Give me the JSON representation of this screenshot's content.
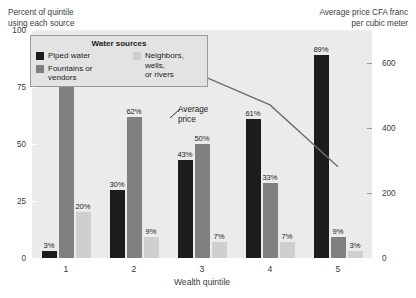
{
  "captions": {
    "left": "Percent of quintile\nusing each source",
    "right": "Average price CFA franc\nper cubic meter"
  },
  "legend": {
    "title": "Water sources",
    "items": [
      {
        "label": "Piped water",
        "color": "#1c1c1c",
        "name": "piped-water"
      },
      {
        "label": "Fountains or\nvendors",
        "color": "#808080",
        "name": "fountains-or-vendors"
      },
      {
        "label": "Neighbors, wells,\nor rivers",
        "color": "#cfcfcf",
        "name": "neighbors-wells-or-rivers"
      }
    ]
  },
  "annotations": {
    "average_price": "Average\nprice"
  },
  "axes": {
    "left_ticks": [
      "0",
      "25",
      "50",
      "75",
      "100"
    ],
    "right_ticks": [
      "0",
      "200",
      "400",
      "600"
    ],
    "x_title": "Wealth quintile",
    "x_ticks": [
      "1",
      "2",
      "3",
      "4",
      "5"
    ]
  },
  "chart_data": {
    "type": "bar",
    "title": "",
    "xlabel": "Wealth quintile",
    "ylabel": "Percent of quintile using each source",
    "y2label": "Average price CFA franc per cubic meter",
    "categories": [
      "1",
      "2",
      "3",
      "4",
      "5"
    ],
    "ylim": [
      0,
      100
    ],
    "yticks": [
      0,
      25,
      50,
      75,
      100
    ],
    "y2lim": [
      0,
      700
    ],
    "y2ticks": [
      0,
      200,
      400,
      600
    ],
    "grid": false,
    "legend_position": "top-left-inside",
    "series": [
      {
        "name": "Piped water",
        "color": "#1c1c1c",
        "values": [
          3,
          30,
          43,
          61,
          89
        ],
        "labels": [
          "3%",
          "30%",
          "43%",
          "61%",
          "89%"
        ]
      },
      {
        "name": "Fountains or vendors",
        "color": "#808080",
        "values": [
          77,
          62,
          50,
          33,
          9
        ],
        "labels": [
          "77%",
          "62%",
          "50%",
          "33%",
          "9%"
        ]
      },
      {
        "name": "Neighbors, wells, or rivers",
        "color": "#cfcfcf",
        "values": [
          20,
          9,
          7,
          7,
          3
        ],
        "labels": [
          "20%",
          "9%",
          "7%",
          "7%",
          "3%"
        ]
      }
    ],
    "overlay_line": {
      "name": "Average price",
      "axis": "right",
      "color": "#6e6e6e",
      "x": [
        "1",
        "2",
        "3",
        "4",
        "5"
      ],
      "values": [
        650,
        600,
        560,
        470,
        280
      ]
    }
  },
  "colors": {
    "plot_background": "#ebebeb",
    "legend_background": "#e3e3e3",
    "legend_border": "#9a9a9a",
    "line": "#6e6e6e",
    "text": "#3b3b3b"
  }
}
